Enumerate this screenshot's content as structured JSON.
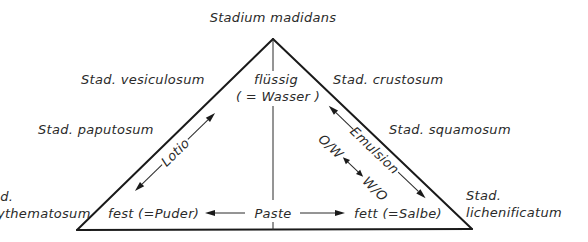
{
  "diagram": {
    "title": "Stadium madidans",
    "vertices": {
      "top": {
        "label_line1": "flüssig",
        "label_line2": "( = Wasser )"
      },
      "bottom_left": {
        "label": "fest (=Puder)"
      },
      "bottom_right": {
        "label": "fett (=Salbe)"
      }
    },
    "edges": {
      "left": {
        "label": "Lotio"
      },
      "right": {
        "label": "Emulsion",
        "sublabel_left": "O/W",
        "sublabel_right": "W/O"
      },
      "bottom": {
        "label": "Paste"
      }
    },
    "stages": {
      "vesiculosum": "Stad. vesiculosum",
      "crustosum": "Stad. crustosum",
      "paputosum": "Stad. paputosum",
      "squamosum": "Stad. squamosum",
      "erythematosum_line1": "Stad.",
      "erythematosum_line2": "erythematosum",
      "lichenificatum_line1": "Stad.",
      "lichenificatum_line2": "lichenificatum"
    },
    "colors": {
      "line": "#1a1a1a",
      "text": "#2a2a2a",
      "background": "#ffffff"
    }
  }
}
